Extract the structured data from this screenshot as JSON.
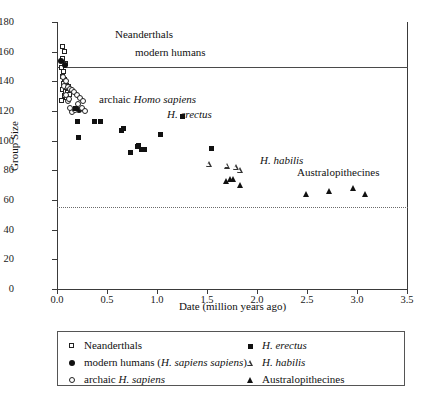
{
  "chart_data": {
    "type": "scatter",
    "title": "",
    "xlabel": "Date (million years ago)",
    "ylabel": "Group Size",
    "xlim": [
      0,
      3.5
    ],
    "ylim": [
      0,
      180
    ],
    "xticks": [
      "0.0",
      "0.5",
      "1.0",
      "1.5",
      "2.0",
      "2.5",
      "3.0",
      "3.5"
    ],
    "xtick_values": [
      0,
      0.5,
      1.0,
      1.5,
      2.0,
      2.5,
      3.0,
      3.5
    ],
    "yticks": [
      "0",
      "20",
      "40",
      "60",
      "80",
      "100",
      "120",
      "140",
      "160",
      "180"
    ],
    "ytick_values": [
      0,
      20,
      40,
      60,
      80,
      100,
      120,
      140,
      160,
      180
    ],
    "grid": false,
    "legend_position": "below-plot",
    "reference_lines": [
      {
        "name": "modern-human-group-size-line",
        "axis": "y",
        "value": 150,
        "style": "solid"
      },
      {
        "name": "lower-bound-line",
        "axis": "y",
        "value": 55,
        "style": "dotted"
      }
    ],
    "annotations": [
      {
        "name": "neanderthals-annotation",
        "text": "Neanderthals",
        "x": 0.58,
        "y": 172,
        "italic": false
      },
      {
        "name": "modern-humans-annotation",
        "text": "modern humans",
        "x": 0.78,
        "y": 160,
        "italic": false
      },
      {
        "name": "archaic-homo-sapiens-annotation",
        "text_plain": "archaic ",
        "text_italic": "Homo sapiens",
        "x": 0.42,
        "y": 128
      },
      {
        "name": "h-erectus-annotation",
        "text_italic": "H. erectus",
        "x": 1.1,
        "y": 118
      },
      {
        "name": "h-habilis-annotation",
        "text_italic": "H. habilis",
        "x": 2.03,
        "y": 87
      },
      {
        "name": "australopithecines-annotation",
        "text_plain": "Australopithecines",
        "x": 2.4,
        "y": 79
      }
    ],
    "series": [
      {
        "name": "Neanderthals",
        "marker": "open-square",
        "color": "#222222",
        "points": [
          [
            0.055,
            163
          ],
          [
            0.075,
            160
          ],
          [
            0.06,
            155
          ],
          [
            0.09,
            152
          ],
          [
            0.05,
            149
          ],
          [
            0.068,
            146
          ],
          [
            0.058,
            143
          ],
          [
            0.082,
            141
          ],
          [
            0.072,
            138
          ],
          [
            0.095,
            137
          ],
          [
            0.062,
            134
          ],
          [
            0.088,
            133
          ],
          [
            0.11,
            132
          ],
          [
            0.125,
            131
          ],
          [
            0.078,
            130
          ],
          [
            0.1,
            129
          ],
          [
            0.052,
            127
          ],
          [
            0.14,
            134
          ],
          [
            0.118,
            136
          ]
        ]
      },
      {
        "name": "modern humans (H. sapiens sapiens)",
        "marker": "filled-circle",
        "color": "#111111",
        "points": [
          [
            0.04,
            154
          ],
          [
            0.075,
            151
          ],
          [
            0.215,
            121
          ]
        ]
      },
      {
        "name": "archaic H. sapiens",
        "marker": "open-circle",
        "color": "#222222",
        "points": [
          [
            0.062,
            143
          ],
          [
            0.085,
            140
          ],
          [
            0.072,
            137
          ],
          [
            0.105,
            136
          ],
          [
            0.125,
            135
          ],
          [
            0.15,
            134
          ],
          [
            0.168,
            133
          ],
          [
            0.195,
            131
          ],
          [
            0.23,
            129
          ],
          [
            0.255,
            127
          ],
          [
            0.21,
            125
          ],
          [
            0.245,
            122
          ],
          [
            0.278,
            120
          ],
          [
            0.15,
            119
          ],
          [
            0.128,
            122
          ],
          [
            0.105,
            127
          ],
          [
            0.09,
            131
          ],
          [
            0.118,
            128
          ],
          [
            0.18,
            121
          ]
        ]
      },
      {
        "name": "H. erectus",
        "marker": "filled-square",
        "color": "#111111",
        "points": [
          [
            0.185,
            122
          ],
          [
            0.2,
            113
          ],
          [
            0.215,
            102
          ],
          [
            0.37,
            113
          ],
          [
            0.43,
            113
          ],
          [
            0.64,
            107
          ],
          [
            0.665,
            108
          ],
          [
            0.735,
            92
          ],
          [
            0.8,
            96
          ],
          [
            0.815,
            97
          ],
          [
            0.845,
            94
          ],
          [
            0.87,
            94
          ],
          [
            1.03,
            104
          ],
          [
            1.25,
            116
          ],
          [
            1.545,
            95
          ]
        ]
      },
      {
        "name": "H. habilis",
        "marker": "open-triangle",
        "color": "#333333",
        "points": [
          [
            1.52,
            84
          ],
          [
            1.7,
            83
          ],
          [
            1.79,
            82
          ],
          [
            1.83,
            80
          ]
        ]
      },
      {
        "name": "Australopithecines",
        "marker": "filled-triangle",
        "color": "#111111",
        "points": [
          [
            1.69,
            73
          ],
          [
            1.73,
            74
          ],
          [
            1.76,
            74
          ],
          [
            1.835,
            70
          ],
          [
            2.495,
            64
          ],
          [
            2.72,
            66
          ],
          [
            2.96,
            68
          ],
          [
            3.08,
            64
          ]
        ]
      }
    ]
  },
  "legend": {
    "left_column": [
      {
        "name": "legend-neanderthals",
        "marker": "open-square",
        "text_plain": "Neanderthals",
        "text_italic": ""
      },
      {
        "name": "legend-modern-humans",
        "marker": "filled-circle",
        "text_plain": "modern humans (",
        "text_italic": "H. sapiens sapiens",
        "text_tail": ")"
      },
      {
        "name": "legend-archaic-sapiens",
        "marker": "open-circle",
        "text_plain": "archaic ",
        "text_italic": "H. sapiens"
      }
    ],
    "right_column": [
      {
        "name": "legend-h-erectus",
        "marker": "filled-square",
        "text_plain": "",
        "text_italic": "H. erectus"
      },
      {
        "name": "legend-h-habilis",
        "marker": "open-triangle",
        "text_plain": "",
        "text_italic": "H. habilis"
      },
      {
        "name": "legend-australopithecines",
        "marker": "filled-triangle",
        "text_plain": "Australopithecines",
        "text_italic": ""
      }
    ]
  }
}
